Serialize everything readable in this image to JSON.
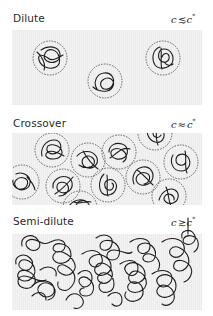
{
  "figure": {
    "type": "polymer-solution-regimes",
    "regimes": [
      {
        "id": "dilute",
        "label": "Dilute",
        "condition": {
          "lhs": "c",
          "relation": "≲",
          "rhs": "c",
          "rhs_superscript": "*"
        },
        "coils": [
          {
            "cx": 38,
            "cy": 28,
            "r": 17
          },
          {
            "cx": 93,
            "cy": 51,
            "r": 17
          },
          {
            "cx": 151,
            "cy": 28,
            "r": 17
          }
        ]
      },
      {
        "id": "crossover",
        "label": "Crossover",
        "condition": {
          "lhs": "c",
          "relation": "≈",
          "rhs": "c",
          "rhs_superscript": "*"
        },
        "coils": [
          {
            "cx": 40,
            "cy": 17,
            "r": 17
          },
          {
            "cx": 10,
            "cy": 49,
            "r": 17
          },
          {
            "cx": 51,
            "cy": 53,
            "r": 17
          },
          {
            "cx": 76,
            "cy": 27,
            "r": 17
          },
          {
            "cx": 107,
            "cy": 19,
            "r": 17
          },
          {
            "cx": 143,
            "cy": 0,
            "r": 17
          },
          {
            "cx": 96,
            "cy": 52,
            "r": 17
          },
          {
            "cx": 131,
            "cy": 44,
            "r": 17
          },
          {
            "cx": 169,
            "cy": 29,
            "r": 17
          },
          {
            "cx": 157,
            "cy": 63,
            "r": 17
          },
          {
            "cx": 68,
            "cy": 75,
            "r": 17
          }
        ]
      },
      {
        "id": "semi-dilute",
        "label": "Semi-dilute",
        "condition": {
          "lhs": "c",
          "relation": "≳",
          "rhs": "c",
          "rhs_superscript": "*"
        }
      }
    ],
    "colors": {
      "panel_bg": "#ececec",
      "coil": "#1e1e1e",
      "halo": "#444444",
      "text": "#2a2a2a"
    }
  }
}
